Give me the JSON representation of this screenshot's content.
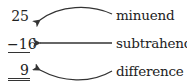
{
  "diagram": {
    "numbers": {
      "minuend": "25",
      "subtrahend": "−16",
      "difference": "9"
    },
    "labels": {
      "minuend": "minuend",
      "subtrahend": "subtrahend",
      "difference": "difference"
    },
    "colors": {
      "ink": "#222222",
      "arrow": "#333333"
    }
  }
}
